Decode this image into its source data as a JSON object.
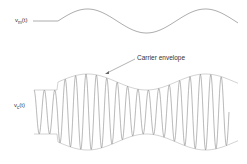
{
  "labels": {
    "modulating_signal": {
      "var": "v",
      "sub": "m",
      "arg": "(t)"
    },
    "carrier_signal": {
      "var": "v",
      "sub": "c",
      "arg": "(t)"
    },
    "carrier_envelope": "Carrier envelope"
  },
  "colors": {
    "wave": "#8a8a8a",
    "envelope": "#b0b0b0",
    "text": "#333333"
  }
}
